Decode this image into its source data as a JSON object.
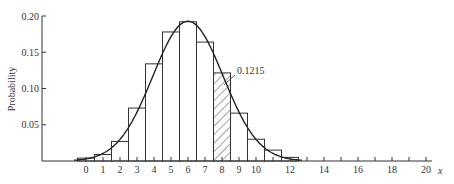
{
  "chart_data": {
    "type": "bar",
    "title": "",
    "xlabel": "x",
    "ylabel": "Probability",
    "ylim": [
      0,
      0.2
    ],
    "xlim": [
      -1,
      20
    ],
    "yticks": [
      0.05,
      0.1,
      0.15,
      0.2
    ],
    "ytick_labels": [
      "0.05",
      "0.10",
      "0.15",
      "0.20"
    ],
    "xticks": [
      0,
      1,
      2,
      3,
      4,
      5,
      6,
      7,
      8,
      9,
      10,
      12,
      14,
      16,
      18,
      20
    ],
    "xtick_labels": [
      "0",
      "1",
      "2",
      "3",
      "4",
      "5",
      "6",
      "7",
      "8",
      "9",
      "10",
      "12",
      "14",
      "16",
      "18",
      "20"
    ],
    "minor_xticks": [
      11,
      13,
      15,
      17,
      19
    ],
    "grid": false,
    "categories": [
      0,
      1,
      2,
      3,
      4,
      5,
      6,
      7,
      8,
      9,
      10,
      11,
      12
    ],
    "values": [
      0.004,
      0.009,
      0.027,
      0.073,
      0.134,
      0.178,
      0.192,
      0.164,
      0.1215,
      0.066,
      0.03,
      0.015,
      0.005
    ],
    "highlighted_bar": {
      "x": 8,
      "value": 0.1215,
      "fill": "hatched"
    },
    "annotation": {
      "text": "0.1215",
      "target_x": 8
    },
    "overlay_curve": {
      "type": "normal-approximation",
      "mean": 6,
      "sd": 2.07,
      "description": "smooth bell curve overlaid on histogram"
    }
  }
}
